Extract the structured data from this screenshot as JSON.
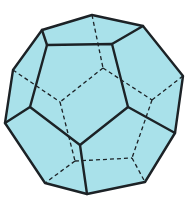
{
  "figure": {
    "fill_color": "#a9e1ea",
    "edge_color": "#1c2226",
    "background": "#ffffff",
    "silhouette": [
      [
        92,
        15
      ],
      [
        143,
        26
      ],
      [
        183,
        76
      ],
      [
        175,
        133
      ],
      [
        145,
        182
      ],
      [
        87,
        194
      ],
      [
        45,
        183
      ],
      [
        5,
        123
      ],
      [
        13,
        70
      ],
      [
        42,
        30
      ]
    ],
    "front_face": [
      [
        47,
        45
      ],
      [
        112,
        44
      ],
      [
        128,
        107
      ],
      [
        80,
        145
      ],
      [
        30,
        107
      ]
    ],
    "visible_edges": [
      [
        [
          42,
          30
        ],
        [
          47,
          45
        ]
      ],
      [
        [
          143,
          26
        ],
        [
          112,
          44
        ]
      ],
      [
        [
          175,
          133
        ],
        [
          128,
          107
        ]
      ],
      [
        [
          87,
          194
        ],
        [
          80,
          145
        ]
      ],
      [
        [
          5,
          123
        ],
        [
          30,
          107
        ]
      ]
    ],
    "hidden_vertices": [
      [
        103,
        68
      ],
      [
        60,
        102
      ],
      [
        152,
        100
      ],
      [
        75,
        161
      ],
      [
        132,
        158
      ]
    ],
    "hidden_edges": [
      [
        [
          92,
          15
        ],
        [
          103,
          68
        ]
      ],
      [
        [
          103,
          68
        ],
        [
          60,
          102
        ]
      ],
      [
        [
          103,
          68
        ],
        [
          152,
          100
        ]
      ],
      [
        [
          13,
          70
        ],
        [
          60,
          102
        ]
      ],
      [
        [
          60,
          102
        ],
        [
          75,
          161
        ]
      ],
      [
        [
          75,
          161
        ],
        [
          132,
          158
        ]
      ],
      [
        [
          152,
          100
        ],
        [
          132,
          158
        ]
      ],
      [
        [
          152,
          100
        ],
        [
          183,
          76
        ]
      ],
      [
        [
          132,
          158
        ],
        [
          145,
          182
        ]
      ],
      [
        [
          75,
          161
        ],
        [
          45,
          183
        ]
      ]
    ]
  }
}
